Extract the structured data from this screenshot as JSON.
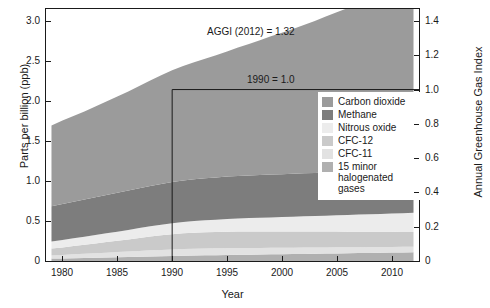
{
  "chart_data": {
    "type": "area",
    "title": "",
    "xlabel": "Year",
    "ylabel": "Parts per billion (ppb)",
    "ylabel_right": "Annual Greenhouse Gas Index",
    "xlim": [
      1978.5,
      2012.5
    ],
    "ylim": [
      0,
      3.15
    ],
    "ylim_right": [
      0,
      1.47
    ],
    "grid": false,
    "stacked": true,
    "legend_position": "center-right",
    "x_ticks": [
      "1980",
      "1985",
      "1990",
      "1995",
      "2000",
      "2005",
      "2010"
    ],
    "x_tick_values": [
      1980,
      1985,
      1990,
      1995,
      2000,
      2005,
      2010
    ],
    "y_ticks_left": [
      "0",
      "0.5",
      "1.0",
      "1.5",
      "2.0",
      "2.5",
      "3.0"
    ],
    "y_tick_values_left": [
      0,
      0.5,
      1.0,
      1.5,
      2.0,
      2.5,
      3.0
    ],
    "y_ticks_right": [
      "0",
      "0.2",
      "0.4",
      "0.6",
      "0.8",
      "1.0",
      "1.2",
      "1.4"
    ],
    "y_tick_values_right": [
      0,
      0.2,
      0.4,
      0.6,
      0.8,
      1.0,
      1.2,
      1.4
    ],
    "x": [
      1979,
      1980,
      1981,
      1982,
      1983,
      1984,
      1985,
      1986,
      1987,
      1988,
      1989,
      1990,
      1991,
      1992,
      1993,
      1994,
      1995,
      1996,
      1997,
      1998,
      1999,
      2000,
      2001,
      2002,
      2003,
      2004,
      2005,
      2006,
      2007,
      2008,
      2009,
      2010,
      2011,
      2012
    ],
    "series": [
      {
        "name": "15 minor halogenated gases",
        "color": "#b0b0b0",
        "values": [
          0.03,
          0.032,
          0.035,
          0.038,
          0.041,
          0.044,
          0.047,
          0.05,
          0.053,
          0.057,
          0.06,
          0.063,
          0.066,
          0.069,
          0.071,
          0.073,
          0.075,
          0.077,
          0.079,
          0.081,
          0.083,
          0.085,
          0.087,
          0.089,
          0.091,
          0.093,
          0.095,
          0.097,
          0.099,
          0.101,
          0.103,
          0.105,
          0.107,
          0.109
        ]
      },
      {
        "name": "CFC-11",
        "color": "#e2e2e2",
        "values": [
          0.04,
          0.044,
          0.048,
          0.052,
          0.056,
          0.06,
          0.064,
          0.068,
          0.072,
          0.076,
          0.079,
          0.082,
          0.084,
          0.085,
          0.086,
          0.086,
          0.086,
          0.085,
          0.084,
          0.083,
          0.082,
          0.081,
          0.08,
          0.079,
          0.078,
          0.077,
          0.076,
          0.075,
          0.074,
          0.073,
          0.072,
          0.071,
          0.07,
          0.069
        ]
      },
      {
        "name": "CFC-12",
        "color": "#cacaca",
        "values": [
          0.085,
          0.094,
          0.103,
          0.112,
          0.122,
          0.132,
          0.142,
          0.152,
          0.163,
          0.173,
          0.182,
          0.19,
          0.196,
          0.2,
          0.203,
          0.205,
          0.206,
          0.206,
          0.206,
          0.205,
          0.204,
          0.203,
          0.202,
          0.201,
          0.2,
          0.198,
          0.197,
          0.195,
          0.194,
          0.192,
          0.19,
          0.189,
          0.187,
          0.185
        ]
      },
      {
        "name": "Nitrous oxide",
        "color": "#ececec",
        "values": [
          0.09,
          0.094,
          0.098,
          0.102,
          0.106,
          0.11,
          0.114,
          0.119,
          0.123,
          0.127,
          0.132,
          0.136,
          0.14,
          0.145,
          0.149,
          0.153,
          0.158,
          0.162,
          0.167,
          0.171,
          0.176,
          0.18,
          0.185,
          0.19,
          0.194,
          0.199,
          0.204,
          0.209,
          0.214,
          0.219,
          0.224,
          0.229,
          0.234,
          0.239
        ]
      },
      {
        "name": "Methane",
        "color": "#7d7d7d",
        "values": [
          0.44,
          0.448,
          0.456,
          0.464,
          0.472,
          0.479,
          0.486,
          0.492,
          0.498,
          0.504,
          0.51,
          0.515,
          0.519,
          0.523,
          0.526,
          0.528,
          0.53,
          0.532,
          0.533,
          0.535,
          0.536,
          0.536,
          0.537,
          0.537,
          0.538,
          0.538,
          0.538,
          0.539,
          0.54,
          0.542,
          0.544,
          0.546,
          0.548,
          0.55
        ]
      },
      {
        "name": "Carbon dioxide",
        "color": "#9b9b9b",
        "values": [
          1.01,
          1.043,
          1.072,
          1.1,
          1.133,
          1.168,
          1.203,
          1.238,
          1.278,
          1.32,
          1.359,
          1.397,
          1.432,
          1.462,
          1.492,
          1.528,
          1.564,
          1.606,
          1.643,
          1.684,
          1.728,
          1.768,
          1.808,
          1.853,
          1.9,
          1.95,
          1.998,
          2.047,
          2.096,
          2.144,
          2.188,
          2.238,
          2.292,
          2.345
        ]
      }
    ],
    "annotations": [
      {
        "name": "aggi-value-note",
        "text": "AGGI (2012) = 1.32",
        "x": 1994.0,
        "y": 2.88
      },
      {
        "name": "reference-year-note",
        "text": "1990 = 1.0",
        "x": 1996.5,
        "y": 2.28
      }
    ],
    "reference_lines": [
      {
        "name": "reference-vertical-1990",
        "orientation": "vertical",
        "value": 1990
      },
      {
        "name": "reference-horizontal-1.0",
        "orientation": "horizontal",
        "value_right_axis": 1.0,
        "value_left_axis": 2.143
      }
    ]
  },
  "legend": {
    "items": [
      {
        "label": "Carbon dioxide",
        "color": "#9b9b9b"
      },
      {
        "label": "Methane",
        "color": "#7d7d7d"
      },
      {
        "label": "Nitrous oxide",
        "color": "#ececec"
      },
      {
        "label": "CFC-12",
        "color": "#cacaca"
      },
      {
        "label": "CFC-11",
        "color": "#e2e2e2"
      },
      {
        "label": "15 minor halogenated gases",
        "color": "#b0b0b0"
      }
    ]
  }
}
